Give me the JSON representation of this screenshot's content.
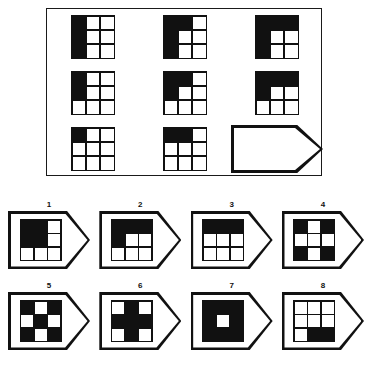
{
  "puzzle": {
    "title": "Matrix reasoning puzzle",
    "grid_size": "3x3",
    "cell_glyph_size": "3x3",
    "colors": {
      "ink": "#111111",
      "paper": "#ffffff"
    },
    "matrix": {
      "name": "matrix-panel",
      "rows": 3,
      "cols": 3,
      "cells": [
        {
          "position": "row1-col1",
          "type": "glyph",
          "description": "left column fully black",
          "pattern": [
            [
              1,
              0,
              0
            ],
            [
              1,
              0,
              0
            ],
            [
              1,
              0,
              0
            ]
          ]
        },
        {
          "position": "row1-col2",
          "type": "glyph",
          "description": "left column black plus top middle black",
          "pattern": [
            [
              1,
              1,
              0
            ],
            [
              1,
              0,
              0
            ],
            [
              1,
              0,
              0
            ]
          ]
        },
        {
          "position": "row1-col3",
          "type": "glyph",
          "description": "left column black plus entire top row black",
          "pattern": [
            [
              1,
              1,
              1
            ],
            [
              1,
              0,
              0
            ],
            [
              1,
              0,
              0
            ]
          ]
        },
        {
          "position": "row2-col1",
          "type": "glyph",
          "description": "top two cells of left column black",
          "pattern": [
            [
              1,
              0,
              0
            ],
            [
              1,
              0,
              0
            ],
            [
              0,
              0,
              0
            ]
          ]
        },
        {
          "position": "row2-col2",
          "type": "glyph",
          "description": "top two cells of left column black plus top middle black",
          "pattern": [
            [
              1,
              1,
              0
            ],
            [
              1,
              0,
              0
            ],
            [
              0,
              0,
              0
            ]
          ]
        },
        {
          "position": "row2-col3",
          "type": "glyph",
          "description": "entire top row black plus middle left black",
          "pattern": [
            [
              1,
              1,
              1
            ],
            [
              1,
              0,
              0
            ],
            [
              0,
              0,
              0
            ]
          ]
        },
        {
          "position": "row3-col1",
          "type": "glyph",
          "description": "top left cell black only",
          "pattern": [
            [
              1,
              0,
              0
            ],
            [
              0,
              0,
              0
            ],
            [
              0,
              0,
              0
            ]
          ]
        },
        {
          "position": "row3-col2",
          "type": "glyph",
          "description": "top left and top middle black",
          "pattern": [
            [
              1,
              1,
              0
            ],
            [
              0,
              0,
              0
            ],
            [
              0,
              0,
              0
            ]
          ]
        },
        {
          "position": "row3-col3",
          "type": "blank",
          "description": "empty answer slot, pentagon tag outline"
        }
      ]
    },
    "options": {
      "name": "answer-options",
      "count": 8,
      "items": [
        {
          "label": "1",
          "description": "two by two black block in top left quadrant",
          "pattern": [
            [
              1,
              1,
              0
            ],
            [
              1,
              1,
              0
            ],
            [
              0,
              0,
              0
            ]
          ]
        },
        {
          "label": "2",
          "description": "entire top row black plus middle left black",
          "pattern": [
            [
              1,
              1,
              1
            ],
            [
              1,
              0,
              0
            ],
            [
              0,
              0,
              0
            ]
          ]
        },
        {
          "label": "3",
          "description": "entire top row black only",
          "pattern": [
            [
              1,
              1,
              1
            ],
            [
              0,
              0,
              0
            ],
            [
              0,
              0,
              0
            ]
          ]
        },
        {
          "label": "4",
          "description": "four corners black, checkerboard with white center",
          "pattern": [
            [
              1,
              0,
              1
            ],
            [
              0,
              0,
              0
            ],
            [
              1,
              0,
              1
            ]
          ]
        },
        {
          "label": "5",
          "description": "checkerboard with black corners and black center",
          "pattern": [
            [
              1,
              0,
              1
            ],
            [
              0,
              1,
              0
            ],
            [
              1,
              0,
              1
            ]
          ]
        },
        {
          "label": "6",
          "description": "black plus sign cross shape",
          "pattern": [
            [
              0,
              1,
              0
            ],
            [
              1,
              1,
              1
            ],
            [
              0,
              1,
              0
            ]
          ]
        },
        {
          "label": "7",
          "description": "all black except white center",
          "pattern": [
            [
              1,
              1,
              1
            ],
            [
              1,
              0,
              1
            ],
            [
              1,
              1,
              1
            ]
          ]
        },
        {
          "label": "8",
          "description": "bottom middle and bottom right black",
          "pattern": [
            [
              0,
              0,
              0
            ],
            [
              0,
              0,
              0
            ],
            [
              0,
              1,
              1
            ]
          ]
        }
      ]
    }
  }
}
